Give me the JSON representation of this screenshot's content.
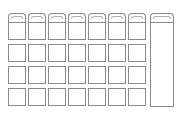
{
  "wireframe": {
    "stroke_color": "#8a8a8a",
    "background": "#ffffff",
    "columns": 7,
    "rows": 4,
    "origin_x": 8,
    "column_pitch": 20,
    "cell_width": 18,
    "tab_top": 13,
    "tab_height": 9,
    "row_tops": [
      22,
      44,
      66,
      88
    ],
    "cell_height": 18,
    "side_panel": {
      "x": 150,
      "y": 22,
      "width": 24,
      "height": 85
    },
    "side_tab": {
      "x": 150,
      "y": 13,
      "width": 24,
      "height": 9
    }
  }
}
